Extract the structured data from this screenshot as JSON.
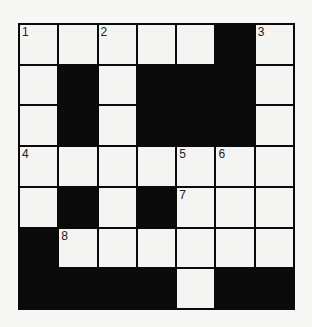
{
  "puzzle": {
    "type": "crossword",
    "rows": 7,
    "cols": 7,
    "grid": [
      [
        "1",
        "",
        "2",
        "",
        "",
        "#",
        "3"
      ],
      [
        "",
        "#",
        "",
        "#",
        "#",
        "#",
        ""
      ],
      [
        "",
        "#",
        "",
        "#",
        "#",
        "#",
        ""
      ],
      [
        "4",
        "",
        "",
        "",
        "5",
        "6",
        ""
      ],
      [
        "",
        "#",
        "",
        "#",
        "7",
        "",
        ""
      ],
      [
        "#",
        "8",
        "",
        "",
        "",
        "",
        ""
      ],
      [
        "#",
        "#",
        "#",
        "#",
        "",
        "#",
        "#"
      ]
    ],
    "colors": {
      "black": "#0a0a0a",
      "white": "#f4f4f2"
    }
  }
}
